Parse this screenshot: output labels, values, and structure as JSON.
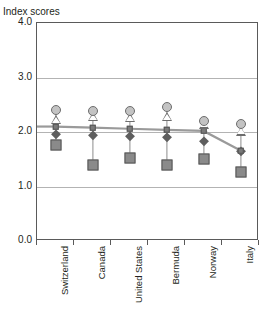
{
  "top_cut_title": "",
  "axis": {
    "y_caption": "Index scores",
    "y_ticks": [
      "4.0",
      "3.0",
      "2.0",
      "1.0",
      "0.0"
    ]
  },
  "chart_data": {
    "type": "scatter",
    "title": "",
    "subtitle": "",
    "xlabel": "",
    "ylabel": "Index scores",
    "ylim": [
      0.0,
      4.0
    ],
    "ytick_values": [
      0.0,
      1.0,
      2.0,
      3.0,
      4.0
    ],
    "grid": true,
    "legend": "none",
    "categories": [
      "Switzerland",
      "Canada",
      "United States",
      "Bermuda",
      "Norway",
      "Italy"
    ],
    "series": [
      {
        "name": "circle-marker",
        "marker": "circle",
        "color": "#c3c3c3",
        "values": [
          2.4,
          2.38,
          2.38,
          2.45,
          2.2,
          2.15
        ]
      },
      {
        "name": "triangle-marker",
        "marker": "triangle",
        "color": "#ffffff",
        "values": [
          2.14,
          2.2,
          2.18,
          2.2,
          2.06,
          1.93
        ]
      },
      {
        "name": "square-line-marker",
        "marker": "square",
        "color": "#7a7a7a",
        "connected": true,
        "values": [
          2.1,
          2.08,
          2.06,
          2.04,
          2.02,
          1.66
        ]
      },
      {
        "name": "diamond-marker",
        "marker": "diamond",
        "color": "#5e5e5e",
        "values": [
          1.97,
          1.94,
          1.92,
          1.9,
          1.84,
          1.66
        ]
      },
      {
        "name": "large-square-marker",
        "marker": "square-large",
        "color": "#8a8a8a",
        "values": [
          1.76,
          1.4,
          1.53,
          1.4,
          1.5,
          1.26
        ]
      }
    ]
  }
}
